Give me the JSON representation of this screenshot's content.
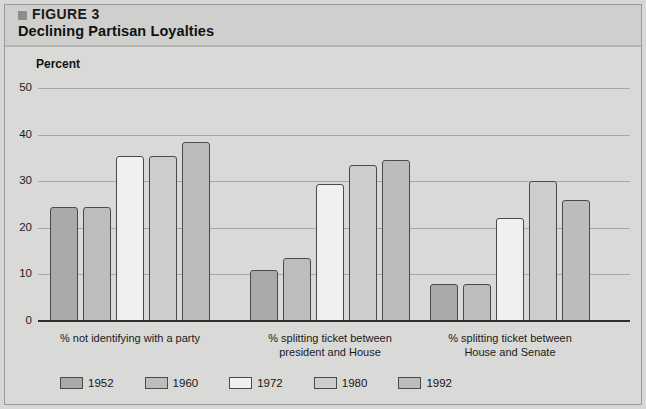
{
  "figure": {
    "bullet_icon": "square-bullet-icon",
    "label": "FIGURE 3",
    "title": "Declining Partisan Loyalties"
  },
  "axis": {
    "ylabel": "Percent",
    "yticks": [
      "50",
      "40",
      "30",
      "20",
      "10",
      "0"
    ]
  },
  "colors": {
    "page_background": "#d9d9d7",
    "header_band": "#cfcfcd",
    "gridline": "#a8a8a6",
    "axis": "#2e2e2e",
    "bar_outline": "#4a4a4a"
  },
  "legend": {
    "position": "bottom-left",
    "items": [
      {
        "label": "1952",
        "color": "#a9a9a7"
      },
      {
        "label": "1960",
        "color": "#bdbdbb"
      },
      {
        "label": "1972",
        "color": "#f0f0ee"
      },
      {
        "label": "1980",
        "color": "#cdcdcb"
      },
      {
        "label": "1992",
        "color": "#bcbcba"
      }
    ]
  },
  "chart_data": {
    "type": "bar",
    "title": "Declining Partisan Loyalties",
    "xlabel": "",
    "ylabel": "Percent",
    "ylim": [
      0,
      50
    ],
    "yticks": [
      0,
      10,
      20,
      30,
      40,
      50
    ],
    "grid": true,
    "legend_position": "bottom-left",
    "categories": [
      "% not identifying with a party",
      "% splitting ticket between president and House",
      "% splitting ticket between House and Senate"
    ],
    "category_lines": [
      [
        "% not identifying with a party"
      ],
      [
        "% splitting ticket between",
        "president and House"
      ],
      [
        "% splitting ticket between",
        "House and Senate"
      ]
    ],
    "series": [
      {
        "name": "1952",
        "color": "#a9a9a7",
        "values": [
          24.5,
          11.0,
          8.0
        ]
      },
      {
        "name": "1960",
        "color": "#bdbdbb",
        "values": [
          24.5,
          13.5,
          8.0
        ]
      },
      {
        "name": "1972",
        "color": "#f0f0ee",
        "values": [
          35.5,
          29.5,
          22.0
        ]
      },
      {
        "name": "1980",
        "color": "#cdcdcb",
        "values": [
          35.5,
          33.5,
          30.0
        ]
      },
      {
        "name": "1992",
        "color": "#bcbcba",
        "values": [
          38.5,
          34.5,
          26.0
        ]
      }
    ]
  }
}
